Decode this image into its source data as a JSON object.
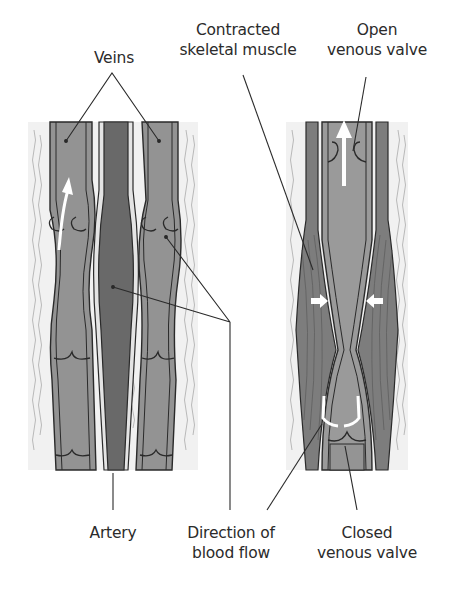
{
  "labels": {
    "veins": "Veins",
    "contracted_muscle": [
      "Contracted",
      "skeletal muscle"
    ],
    "open_valve": [
      "Open",
      "venous valve"
    ],
    "artery": "Artery",
    "direction_flow": [
      "Direction of",
      "blood flow"
    ],
    "closed_valve": [
      "Closed",
      "venous valve"
    ]
  },
  "colors": {
    "vein_fill": "#8f8f8f",
    "artery_fill": "#6a6a6a",
    "wall_light": "#e6e6e6",
    "tissue_bg": "#f2f2f2",
    "muscle_fill": "#7c7c7c",
    "outline": "#2a2a2a",
    "arrow": "#ffffff"
  }
}
